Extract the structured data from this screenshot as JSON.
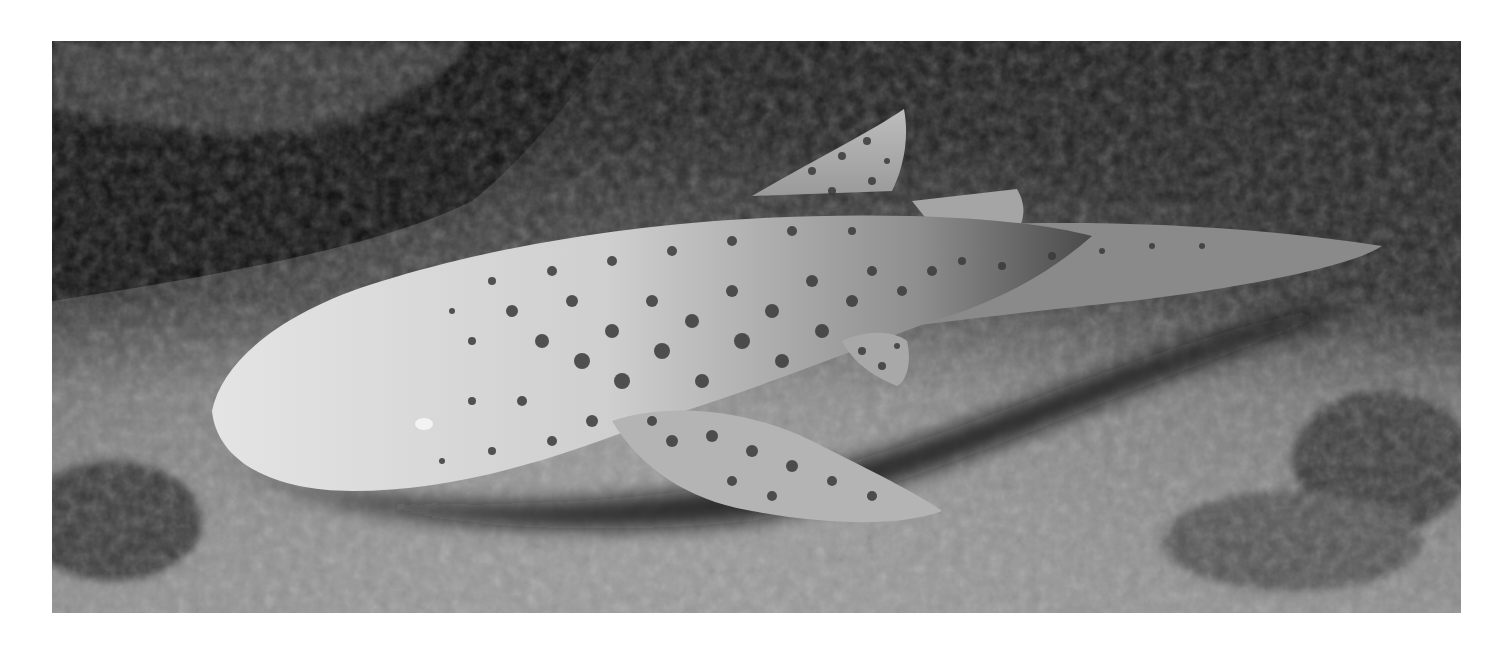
{
  "image": {
    "subject": "spotted shark resting on seabed",
    "style": "grayscale underwater photograph",
    "colors": {
      "background": "#ffffff",
      "rock_dark": "#141414",
      "seabed": "#8a8a8a",
      "shark_body": "#d6d6d6",
      "spots": "#3a3a3a"
    }
  }
}
